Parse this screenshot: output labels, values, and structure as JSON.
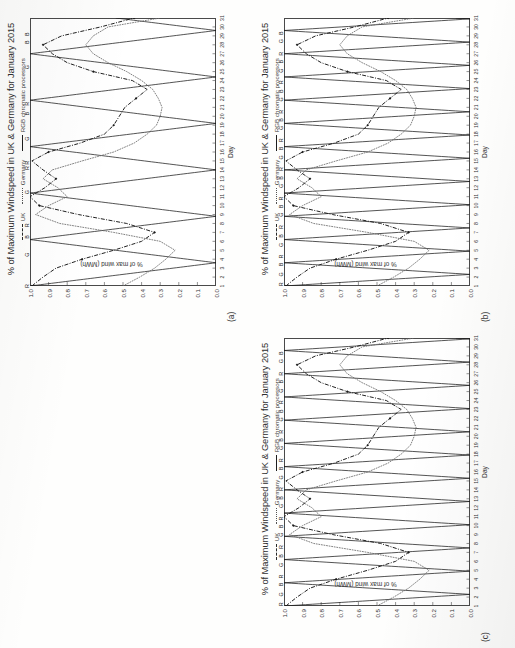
{
  "page": {
    "background": "#fefefd",
    "panels": [
      {
        "tag": "(a)",
        "id": "panel-a"
      },
      {
        "tag": "(b)",
        "id": "panel-b"
      },
      {
        "tag": "(c)",
        "id": "panel-c"
      }
    ]
  },
  "chart_common": {
    "title": "% of Maximum Windspeed in UK & Germany for January 2015",
    "xlabel": "Day",
    "ylabel": "% of max wind (MWh)",
    "legend": [
      {
        "label": "UK",
        "style": "dash-dot",
        "color": "#2a2a2a"
      },
      {
        "label": "Germany",
        "style": "dotted",
        "color": "#555555"
      },
      {
        "label": "RGB chromatic processors",
        "style": "solid",
        "color": "#1e1e1e"
      }
    ],
    "yticks": [
      "1.0",
      "0.9",
      "0.8",
      "0.7",
      "0.6",
      "0.5",
      "0.4",
      "0.3",
      "0.2",
      "0.1",
      "0.0"
    ],
    "xticks": [
      "1",
      "2",
      "3",
      "4",
      "5",
      "6",
      "7",
      "8",
      "9",
      "10",
      "11",
      "12",
      "13",
      "14",
      "15",
      "16",
      "17",
      "18",
      "19",
      "20",
      "21",
      "22",
      "23",
      "24",
      "25",
      "26",
      "27",
      "28",
      "29",
      "30",
      "31"
    ]
  },
  "chart_data": [
    {
      "type": "line",
      "panel": "(a)",
      "title": "% of Maximum Windspeed in UK & Germany for January 2015",
      "xlabel": "Day",
      "ylabel": "% of max wind (MWh)",
      "xlim": [
        1,
        31
      ],
      "ylim": [
        0.0,
        1.0
      ],
      "grid": false,
      "legend_position": "top-center",
      "x": [
        1,
        2,
        3,
        4,
        5,
        6,
        7,
        8,
        9,
        10,
        11,
        12,
        13,
        14,
        15,
        16,
        17,
        18,
        19,
        20,
        21,
        22,
        23,
        24,
        25,
        26,
        27,
        28,
        29,
        30,
        31
      ],
      "series": [
        {
          "name": "UK",
          "style": "dash-dot",
          "marker": "diamond",
          "values": [
            0.99,
            0.93,
            0.86,
            0.72,
            0.55,
            0.4,
            0.33,
            0.48,
            0.74,
            0.95,
            1.0,
            0.92,
            0.86,
            0.93,
            0.99,
            0.9,
            0.73,
            0.6,
            0.55,
            0.52,
            0.49,
            0.43,
            0.37,
            0.45,
            0.66,
            0.8,
            0.88,
            0.93,
            0.83,
            0.62,
            0.44
          ]
        },
        {
          "name": "Germany",
          "style": "dotted",
          "marker": "none",
          "values": [
            0.5,
            0.41,
            0.33,
            0.27,
            0.22,
            0.3,
            0.55,
            0.84,
            0.97,
            0.9,
            0.8,
            0.85,
            0.93,
            0.88,
            0.72,
            0.55,
            0.44,
            0.37,
            0.32,
            0.3,
            0.29,
            0.31,
            0.34,
            0.4,
            0.48,
            0.58,
            0.66,
            0.7,
            0.66,
            0.58,
            0.3
          ]
        },
        {
          "name": "RGB chromatic processors",
          "style": "solid",
          "marker": "none",
          "description": "Sawtooth triangular carrier, 6 full cycles across the month, full scale 0.0 to 1.0",
          "cycle_days": 5.2,
          "amplitude": [
            0.0,
            1.0
          ]
        }
      ],
      "rgb_markers": [
        {
          "day": 1,
          "letter": "R"
        },
        {
          "day": 4.5,
          "letter": "G"
        },
        {
          "day": 6.5,
          "letter": "B"
        },
        {
          "day": 7.8,
          "letter": "R"
        },
        {
          "day": 11.5,
          "letter": "G"
        },
        {
          "day": 14.2,
          "letter": "R"
        },
        {
          "day": 14.8,
          "letter": "R"
        },
        {
          "day": 17.5,
          "letter": "G"
        },
        {
          "day": 20.3,
          "letter": "B"
        },
        {
          "day": 21.4,
          "letter": "R"
        },
        {
          "day": 25.5,
          "letter": "G"
        },
        {
          "day": 28.3,
          "letter": "B"
        },
        {
          "day": 29.2,
          "letter": "B"
        }
      ]
    },
    {
      "type": "line",
      "panel": "(b)",
      "title": "% of Maximum Windspeed in UK & Germany for January 2015",
      "xlabel": "Day",
      "ylabel": "% of max wind (MWh)",
      "xlim": [
        1,
        31
      ],
      "ylim": [
        0.0,
        1.0
      ],
      "grid": false,
      "legend_position": "top-center",
      "x": [
        1,
        2,
        3,
        4,
        5,
        6,
        7,
        8,
        9,
        10,
        11,
        12,
        13,
        14,
        15,
        16,
        17,
        18,
        19,
        20,
        21,
        22,
        23,
        24,
        25,
        26,
        27,
        28,
        29,
        30,
        31
      ],
      "series": [
        {
          "name": "UK",
          "style": "dash-dot",
          "marker": "diamond",
          "values": [
            0.99,
            0.93,
            0.86,
            0.72,
            0.55,
            0.4,
            0.33,
            0.48,
            0.74,
            0.95,
            1.0,
            0.92,
            0.86,
            0.93,
            0.99,
            0.9,
            0.73,
            0.6,
            0.55,
            0.52,
            0.49,
            0.43,
            0.37,
            0.45,
            0.66,
            0.8,
            0.88,
            0.93,
            0.83,
            0.62,
            0.44
          ]
        },
        {
          "name": "Germany",
          "style": "dotted",
          "marker": "none",
          "values": [
            0.5,
            0.41,
            0.33,
            0.27,
            0.22,
            0.3,
            0.55,
            0.84,
            0.97,
            0.9,
            0.8,
            0.85,
            0.93,
            0.88,
            0.72,
            0.55,
            0.44,
            0.37,
            0.32,
            0.3,
            0.29,
            0.31,
            0.34,
            0.4,
            0.48,
            0.58,
            0.66,
            0.7,
            0.66,
            0.58,
            0.3
          ]
        },
        {
          "name": "RGB chromatic processors",
          "style": "solid",
          "marker": "none",
          "description": "Sawtooth triangular carrier, 12 full cycles across the month, full scale 0.0 to 1.0",
          "cycle_days": 2.6,
          "amplitude": [
            0.0,
            1.0
          ]
        }
      ],
      "rgb_markers": [
        {
          "day": 1.2,
          "letter": "R"
        },
        {
          "day": 2.3,
          "letter": "G"
        },
        {
          "day": 3.4,
          "letter": "B"
        },
        {
          "day": 4.3,
          "letter": "R"
        },
        {
          "day": 5.6,
          "letter": "G"
        },
        {
          "day": 6.6,
          "letter": "B"
        },
        {
          "day": 7.6,
          "letter": "R"
        },
        {
          "day": 9.0,
          "letter": "G"
        },
        {
          "day": 9.9,
          "letter": "B"
        },
        {
          "day": 10.8,
          "letter": "R"
        },
        {
          "day": 12.2,
          "letter": "G"
        },
        {
          "day": 13.1,
          "letter": "B"
        },
        {
          "day": 14.1,
          "letter": "R"
        },
        {
          "day": 15.4,
          "letter": "G"
        },
        {
          "day": 16.4,
          "letter": "B"
        },
        {
          "day": 17.3,
          "letter": "R"
        },
        {
          "day": 18.7,
          "letter": "G"
        },
        {
          "day": 19.6,
          "letter": "B"
        },
        {
          "day": 20.5,
          "letter": "R"
        },
        {
          "day": 21.9,
          "letter": "G"
        },
        {
          "day": 22.8,
          "letter": "B"
        },
        {
          "day": 23.8,
          "letter": "R"
        },
        {
          "day": 25.1,
          "letter": "G"
        },
        {
          "day": 26.1,
          "letter": "B"
        },
        {
          "day": 27.0,
          "letter": "R"
        },
        {
          "day": 28.4,
          "letter": "G"
        },
        {
          "day": 29.3,
          "letter": "B"
        }
      ]
    },
    {
      "type": "line",
      "panel": "(c)",
      "title": "% of Maximum Windspeed in UK & Germany for January 2015",
      "xlabel": "Day",
      "ylabel": "% of max wind (MWh)",
      "xlim": [
        1,
        31
      ],
      "ylim": [
        0.0,
        1.0
      ],
      "grid": false,
      "legend_position": "top-center",
      "x": [
        1,
        2,
        3,
        4,
        5,
        6,
        7,
        8,
        9,
        10,
        11,
        12,
        13,
        14,
        15,
        16,
        17,
        18,
        19,
        20,
        21,
        22,
        23,
        24,
        25,
        26,
        27,
        28,
        29,
        30,
        31
      ],
      "series": [
        {
          "name": "UK",
          "style": "dash-dot",
          "marker": "diamond",
          "values": [
            0.99,
            0.93,
            0.86,
            0.72,
            0.55,
            0.4,
            0.33,
            0.48,
            0.74,
            0.95,
            1.0,
            0.92,
            0.86,
            0.93,
            0.99,
            0.9,
            0.73,
            0.6,
            0.55,
            0.52,
            0.49,
            0.43,
            0.37,
            0.45,
            0.66,
            0.8,
            0.88,
            0.93,
            0.83,
            0.62,
            0.44
          ]
        },
        {
          "name": "Germany",
          "style": "dotted",
          "marker": "none",
          "values": [
            0.5,
            0.41,
            0.33,
            0.27,
            0.22,
            0.3,
            0.55,
            0.84,
            0.97,
            0.9,
            0.8,
            0.85,
            0.93,
            0.88,
            0.72,
            0.55,
            0.44,
            0.37,
            0.32,
            0.3,
            0.29,
            0.31,
            0.34,
            0.4,
            0.48,
            0.58,
            0.66,
            0.7,
            0.66,
            0.58,
            0.3
          ]
        },
        {
          "name": "RGB chromatic processors",
          "style": "solid",
          "marker": "none",
          "description": "Sawtooth triangular carrier, 12 full cycles across the month, full scale 0.0 to 1.0",
          "cycle_days": 2.6,
          "amplitude": [
            0.0,
            1.0
          ]
        }
      ],
      "rgb_markers": [
        {
          "day": 1.2,
          "letter": "R"
        },
        {
          "day": 2.3,
          "letter": "G"
        },
        {
          "day": 3.4,
          "letter": "B"
        },
        {
          "day": 4.3,
          "letter": "R"
        },
        {
          "day": 5.6,
          "letter": "G"
        },
        {
          "day": 6.6,
          "letter": "B"
        },
        {
          "day": 7.6,
          "letter": "R"
        },
        {
          "day": 9.0,
          "letter": "G"
        },
        {
          "day": 9.9,
          "letter": "B"
        },
        {
          "day": 10.8,
          "letter": "R"
        },
        {
          "day": 12.2,
          "letter": "G"
        },
        {
          "day": 13.1,
          "letter": "B"
        },
        {
          "day": 14.1,
          "letter": "R"
        },
        {
          "day": 15.4,
          "letter": "G"
        },
        {
          "day": 16.4,
          "letter": "B"
        },
        {
          "day": 17.3,
          "letter": "R"
        },
        {
          "day": 18.7,
          "letter": "G"
        },
        {
          "day": 19.6,
          "letter": "B"
        },
        {
          "day": 20.5,
          "letter": "R"
        },
        {
          "day": 21.9,
          "letter": "G"
        },
        {
          "day": 22.8,
          "letter": "B"
        },
        {
          "day": 23.8,
          "letter": "R"
        },
        {
          "day": 25.1,
          "letter": "G"
        },
        {
          "day": 26.1,
          "letter": "B"
        },
        {
          "day": 27.0,
          "letter": "R"
        },
        {
          "day": 28.4,
          "letter": "G"
        },
        {
          "day": 29.3,
          "letter": "B"
        }
      ]
    }
  ]
}
